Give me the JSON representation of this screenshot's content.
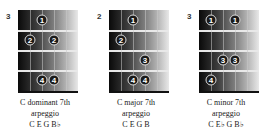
{
  "diagrams": [
    {
      "fret_number": "3",
      "title": "C dominant 7th",
      "subtitle": "arpeggio",
      "notes": "C E G B♭",
      "dots": [
        {
          "finger": "1",
          "string": 2,
          "fret": 1
        },
        {
          "finger": "2",
          "string": 1,
          "fret": 2
        },
        {
          "finger": "2",
          "string": 3,
          "fret": 2
        },
        {
          "finger": "4",
          "string": 2,
          "fret": 4
        },
        {
          "finger": "4",
          "string": 3,
          "fret": 4
        }
      ]
    },
    {
      "fret_number": "2",
      "title": "C major 7th",
      "subtitle": "arpeggio",
      "notes": "C E G B",
      "dots": [
        {
          "finger": "1",
          "string": 2,
          "fret": 1
        },
        {
          "finger": "2",
          "string": 1,
          "fret": 2
        },
        {
          "finger": "3",
          "string": 3,
          "fret": 3
        },
        {
          "finger": "4",
          "string": 2,
          "fret": 4
        },
        {
          "finger": "4",
          "string": 3,
          "fret": 4
        }
      ]
    },
    {
      "fret_number": "3",
      "title": "C minor 7th",
      "subtitle": "arpeggio",
      "notes": "C E♭ G B♭",
      "dots": [
        {
          "finger": "1",
          "string": 1,
          "fret": 1
        },
        {
          "finger": "1",
          "string": 3,
          "fret": 1
        },
        {
          "finger": "3",
          "string": 2,
          "fret": 3
        },
        {
          "finger": "3",
          "string": 3,
          "fret": 3
        },
        {
          "finger": "4",
          "string": 1,
          "fret": 4
        }
      ]
    }
  ]
}
